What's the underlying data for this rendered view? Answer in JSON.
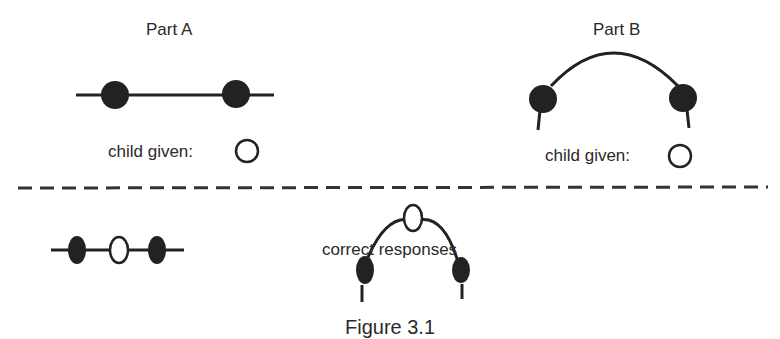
{
  "part_a": {
    "title": "Part A",
    "given_label": "child given:"
  },
  "part_b": {
    "title": "Part B",
    "given_label": "child given:"
  },
  "middle_label": "correct responses",
  "caption": "Figure 3.1",
  "colors": {
    "ink": "#222222",
    "background": "#ffffff"
  }
}
